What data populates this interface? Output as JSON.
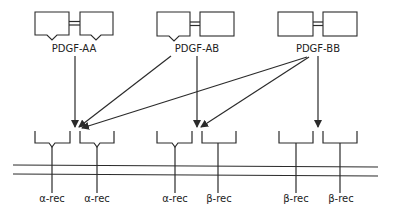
{
  "diagram": {
    "ligands": [
      {
        "id": "aa",
        "label": "PDGF-AA",
        "left_notch": true,
        "right_notch": true
      },
      {
        "id": "ab",
        "label": "PDGF-AB",
        "left_notch": true,
        "right_notch": false
      },
      {
        "id": "bb",
        "label": "PDGF-BB",
        "left_notch": false,
        "right_notch": false
      }
    ],
    "receptors": [
      {
        "label": "α-rec",
        "type": "alpha"
      },
      {
        "label": "α-rec",
        "type": "alpha"
      },
      {
        "label": "α-rec",
        "type": "alpha"
      },
      {
        "label": "β-rec",
        "type": "beta"
      },
      {
        "label": "β-rec",
        "type": "beta"
      },
      {
        "label": "β-rec",
        "type": "beta"
      }
    ],
    "binding_arrows": [
      {
        "from": "PDGF-AA",
        "to": "αα dimer site"
      },
      {
        "from": "PDGF-AB",
        "to": "αα dimer site"
      },
      {
        "from": "PDGF-AB",
        "to": "αβ dimer site"
      },
      {
        "from": "PDGF-BB",
        "to": "αα dimer site"
      },
      {
        "from": "PDGF-BB",
        "to": "αβ dimer site"
      },
      {
        "from": "PDGF-BB",
        "to": "ββ dimer site"
      }
    ],
    "colors": {
      "line": "#2b2b2b",
      "background": "#ffffff"
    }
  }
}
